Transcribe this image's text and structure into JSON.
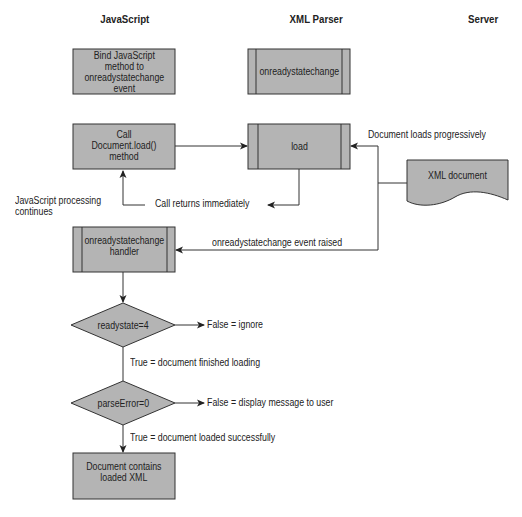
{
  "columns": {
    "javascript": "JavaScript",
    "xml_parser": "XML Parser",
    "server": "Server"
  },
  "nodes": {
    "bind_method": "Bind JavaScript\nmethod to\nonreadystatechange\nevent",
    "xml_onreadystatechange": "onreadystatechange",
    "call_load": "Call\nDocument.load()\nmethod",
    "load": "load",
    "xml_document": "XML document",
    "handler": "onreadystatechange\nhandler",
    "decision_readystate": "readystate=4",
    "decision_parseerror": "parseError=0",
    "result": "Document contains\nloaded XML"
  },
  "edge_labels": {
    "js_continues": "JavaScript processing\ncontinues",
    "call_returns": "Call returns immediately",
    "doc_loads": "Document loads progressively",
    "event_raised": "onreadystatechange event raised",
    "readystate_false": "False = ignore",
    "readystate_true": "True = document finished loading",
    "parseerror_false": "False = display message to user",
    "parseerror_true": "True = document loaded successfully"
  },
  "colors": {
    "box_fill": "#b4b4b4",
    "stroke": "#333333",
    "background": "#ffffff"
  }
}
